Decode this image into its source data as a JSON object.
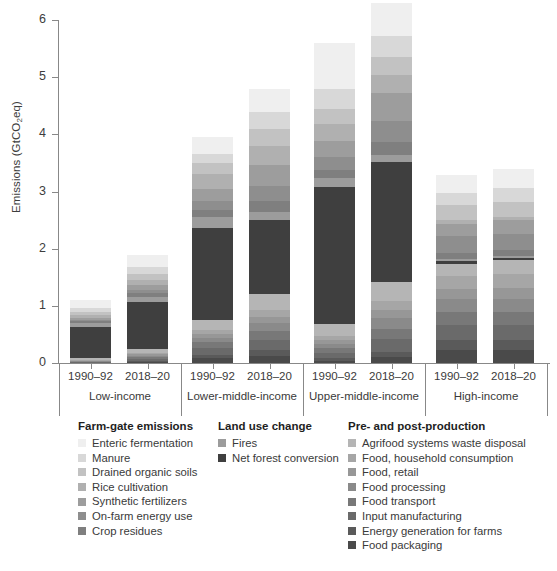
{
  "chart_data": {
    "type": "bar",
    "stacked": true,
    "title": "",
    "xlabel": "",
    "ylabel": "Emissions (GtCO2eq)",
    "ylim": [
      0,
      6
    ],
    "yticks": [
      0,
      1,
      2,
      3,
      4,
      5,
      6
    ],
    "grid": false,
    "legend_position": "bottom",
    "groups": [
      {
        "name": "Low-income",
        "periods": [
          "1990–92",
          "2018–20"
        ]
      },
      {
        "name": "Lower-middle-income",
        "periods": [
          "1990–92",
          "2018–20"
        ]
      },
      {
        "name": "Upper-middle-income",
        "periods": [
          "1990–92",
          "2018–20"
        ]
      },
      {
        "name": "High-income",
        "periods": [
          "1990–92",
          "2018–20"
        ]
      }
    ],
    "categories": [
      "Low-income 1990–92",
      "Low-income 2018–20",
      "Lower-middle-income 1990–92",
      "Lower-middle-income 2018–20",
      "Upper-middle-income 1990–92",
      "Upper-middle-income 2018–20",
      "High-income 1990–92",
      "High-income 2018–20"
    ],
    "totals": [
      1.1,
      1.8,
      3.95,
      4.8,
      5.6,
      6.0,
      3.3,
      3.4
    ],
    "series": [
      {
        "name": "Food packaging",
        "color": "#4a4a4a",
        "values": [
          0.0,
          0.02,
          0.08,
          0.12,
          0.04,
          0.1,
          0.22,
          0.22
        ]
      },
      {
        "name": "Energy generation for farms",
        "color": "#5a5a5a",
        "values": [
          0.0,
          0.02,
          0.06,
          0.1,
          0.04,
          0.1,
          0.18,
          0.18
        ]
      },
      {
        "name": "Input manufacturing",
        "color": "#6a6a6a",
        "values": [
          0.01,
          0.03,
          0.12,
          0.18,
          0.1,
          0.22,
          0.26,
          0.26
        ]
      },
      {
        "name": "Food transport",
        "color": "#787878",
        "values": [
          0.01,
          0.03,
          0.1,
          0.16,
          0.08,
          0.18,
          0.24,
          0.24
        ]
      },
      {
        "name": "Food processing",
        "color": "#8a8a8a",
        "values": [
          0.01,
          0.03,
          0.08,
          0.14,
          0.08,
          0.18,
          0.22,
          0.22
        ]
      },
      {
        "name": "Food, retail",
        "color": "#979797",
        "values": [
          0.01,
          0.02,
          0.06,
          0.1,
          0.06,
          0.14,
          0.18,
          0.2
        ]
      },
      {
        "name": "Food, household consumption",
        "color": "#a6a6a6",
        "values": [
          0.01,
          0.03,
          0.07,
          0.12,
          0.08,
          0.16,
          0.22,
          0.24
        ]
      },
      {
        "name": "Agrifood systems waste disposal",
        "color": "#b5b5b5",
        "values": [
          0.03,
          0.06,
          0.18,
          0.28,
          0.2,
          0.34,
          0.22,
          0.24
        ]
      },
      {
        "name": "Net forest conversion",
        "color": "#3f3f3f",
        "values": [
          0.55,
          0.82,
          1.62,
          1.3,
          2.4,
          2.1,
          0.05,
          0.04
        ]
      },
      {
        "name": "Fires",
        "color": "#9c9c9c",
        "values": [
          0.07,
          0.1,
          0.18,
          0.14,
          0.16,
          0.12,
          0.03,
          0.03
        ]
      },
      {
        "name": "Crop residues",
        "color": "#7f7f7f",
        "values": [
          0.03,
          0.06,
          0.13,
          0.2,
          0.13,
          0.22,
          0.1,
          0.11
        ]
      },
      {
        "name": "On-farm energy use",
        "color": "#8e8e8e",
        "values": [
          0.03,
          0.06,
          0.16,
          0.26,
          0.24,
          0.38,
          0.3,
          0.28
        ]
      },
      {
        "name": "Synthetic fertilizers",
        "color": "#9d9d9d",
        "values": [
          0.03,
          0.08,
          0.2,
          0.36,
          0.28,
          0.48,
          0.22,
          0.24
        ]
      },
      {
        "name": "Rice cultivation",
        "color": "#b0b0b0",
        "values": [
          0.05,
          0.1,
          0.26,
          0.34,
          0.3,
          0.32,
          0.06,
          0.06
        ]
      },
      {
        "name": "Drained organic soils",
        "color": "#c2c2c2",
        "values": [
          0.06,
          0.1,
          0.2,
          0.3,
          0.26,
          0.32,
          0.26,
          0.26
        ]
      },
      {
        "name": "Manure",
        "color": "#d8d8d8",
        "values": [
          0.07,
          0.12,
          0.15,
          0.3,
          0.35,
          0.36,
          0.22,
          0.24
        ]
      },
      {
        "name": "Enteric fermentation",
        "color": "#efefef",
        "values": [
          0.13,
          0.22,
          0.3,
          0.4,
          0.8,
          0.58,
          0.32,
          0.34
        ]
      }
    ]
  },
  "axis": {
    "y_label_main": "Emissions (GtCO",
    "y_label_sub": "2",
    "y_label_tail": "eq)",
    "ticks": [
      "0",
      "1",
      "2",
      "3",
      "4",
      "5",
      "6"
    ]
  },
  "legend": {
    "columns": [
      {
        "title": "Farm-gate emissions",
        "items": [
          {
            "label": "Enteric fermentation",
            "color": "#efefef"
          },
          {
            "label": "Manure",
            "color": "#d8d8d8"
          },
          {
            "label": "Drained organic soils",
            "color": "#c2c2c2"
          },
          {
            "label": "Rice cultivation",
            "color": "#b0b0b0"
          },
          {
            "label": "Synthetic fertilizers",
            "color": "#9d9d9d"
          },
          {
            "label": "On-farm energy use",
            "color": "#8e8e8e"
          },
          {
            "label": "Crop residues",
            "color": "#7f7f7f"
          }
        ]
      },
      {
        "title": "Land use change",
        "items": [
          {
            "label": "Fires",
            "color": "#9c9c9c"
          },
          {
            "label": "Net forest conversion",
            "color": "#3f3f3f"
          }
        ]
      },
      {
        "title": "Pre- and post-production",
        "items": [
          {
            "label": "Agrifood systems waste disposal",
            "color": "#b5b5b5"
          },
          {
            "label": "Food, household consumption",
            "color": "#a6a6a6"
          },
          {
            "label": "Food, retail",
            "color": "#979797"
          },
          {
            "label": "Food processing",
            "color": "#8a8a8a"
          },
          {
            "label": "Food transport",
            "color": "#787878"
          },
          {
            "label": "Input manufacturing",
            "color": "#6a6a6a"
          },
          {
            "label": "Energy generation for farms",
            "color": "#5a5a5a"
          },
          {
            "label": "Food packaging",
            "color": "#4a4a4a"
          }
        ]
      }
    ]
  }
}
